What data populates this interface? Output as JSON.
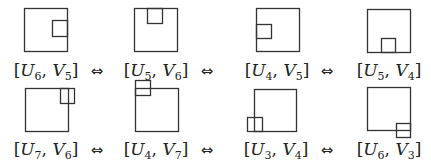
{
  "diagram": {
    "stroke_color": "#333333",
    "arrow_symbol": "⇔",
    "rows": [
      {
        "items": [
          {
            "label_u": "U",
            "u_sub": "6",
            "label_v": "V",
            "v_sub": "5",
            "inner_position": "right-middle"
          },
          {
            "label_u": "U",
            "u_sub": "5",
            "label_v": "V",
            "v_sub": "6",
            "inner_position": "top-middle"
          },
          {
            "label_u": "U",
            "u_sub": "4",
            "label_v": "V",
            "v_sub": "5",
            "inner_position": "left-middle"
          },
          {
            "label_u": "U",
            "u_sub": "5",
            "label_v": "V",
            "v_sub": "4",
            "inner_position": "bottom-middle"
          }
        ]
      },
      {
        "items": [
          {
            "label_u": "U",
            "u_sub": "7",
            "label_v": "V",
            "v_sub": "6",
            "inner_position": "top-right-straddling-right-edge"
          },
          {
            "label_u": "U",
            "u_sub": "4",
            "label_v": "V",
            "v_sub": "7",
            "inner_position": "top-left-straddling-top-edge"
          },
          {
            "label_u": "U",
            "u_sub": "3",
            "label_v": "V",
            "v_sub": "4",
            "inner_position": "bottom-left-straddling-left-edge"
          },
          {
            "label_u": "U",
            "u_sub": "6",
            "label_v": "V",
            "v_sub": "3",
            "inner_position": "bottom-right-straddling-bottom-edge"
          }
        ]
      }
    ]
  }
}
